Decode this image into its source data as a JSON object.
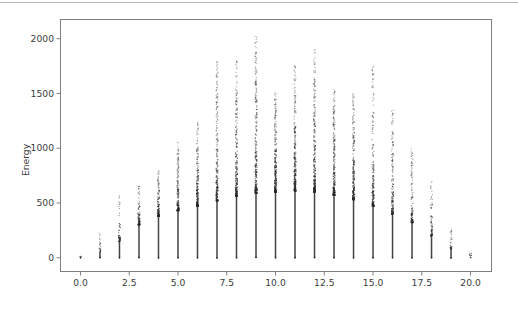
{
  "figure": {
    "background_color": "#ffffff",
    "axes_edge_color": "#7f7f7f",
    "tick_label_color": "#3b3b3b",
    "marker_color": "#2a2a2a",
    "top_rule_color": "#b9b9b9"
  },
  "chart_data": {
    "type": "scatter",
    "title": "",
    "subtitle": "",
    "xlabel": "",
    "ylabel": "Energy",
    "xlim": [
      -1.05,
      21.1
    ],
    "ylim": [
      -130,
      2180
    ],
    "xticks": [
      0.0,
      2.5,
      5.0,
      7.5,
      10.0,
      12.5,
      15.0,
      17.5,
      20.0
    ],
    "xticklabels": [
      "0.0",
      "2.5",
      "5.0",
      "7.5",
      "10.0",
      "12.5",
      "15.0",
      "17.5",
      "20.0"
    ],
    "yticks": [
      0,
      500,
      1000,
      1500,
      2000
    ],
    "yticklabels": [
      "0",
      "500",
      "1000",
      "1500",
      "2000"
    ],
    "grid": false,
    "legend": null,
    "legend_position": "none",
    "marker": "point",
    "marker_size": 1.2,
    "columns": [
      {
        "x": 0,
        "max_energy": 20,
        "dense_top": 8,
        "n_points": 3
      },
      {
        "x": 1,
        "max_energy": 230,
        "dense_top": 60,
        "n_points": 18
      },
      {
        "x": 2,
        "max_energy": 650,
        "dense_top": 150,
        "n_points": 48
      },
      {
        "x": 3,
        "max_energy": 660,
        "dense_top": 300,
        "n_points": 90
      },
      {
        "x": 4,
        "max_energy": 800,
        "dense_top": 380,
        "n_points": 130
      },
      {
        "x": 5,
        "max_energy": 1060,
        "dense_top": 430,
        "n_points": 160
      },
      {
        "x": 6,
        "max_energy": 1250,
        "dense_top": 470,
        "n_points": 190
      },
      {
        "x": 7,
        "max_energy": 1800,
        "dense_top": 520,
        "n_points": 215
      },
      {
        "x": 8,
        "max_energy": 1810,
        "dense_top": 560,
        "n_points": 235
      },
      {
        "x": 9,
        "max_energy": 2050,
        "dense_top": 590,
        "n_points": 250
      },
      {
        "x": 10,
        "max_energy": 1520,
        "dense_top": 600,
        "n_points": 255
      },
      {
        "x": 11,
        "max_energy": 1770,
        "dense_top": 610,
        "n_points": 258
      },
      {
        "x": 12,
        "max_energy": 1900,
        "dense_top": 600,
        "n_points": 252
      },
      {
        "x": 13,
        "max_energy": 1540,
        "dense_top": 570,
        "n_points": 240
      },
      {
        "x": 14,
        "max_energy": 1520,
        "dense_top": 530,
        "n_points": 215
      },
      {
        "x": 15,
        "max_energy": 1780,
        "dense_top": 470,
        "n_points": 185
      },
      {
        "x": 16,
        "max_energy": 1350,
        "dense_top": 400,
        "n_points": 150
      },
      {
        "x": 17,
        "max_energy": 1000,
        "dense_top": 320,
        "n_points": 110
      },
      {
        "x": 18,
        "max_energy": 700,
        "dense_top": 200,
        "n_points": 65
      },
      {
        "x": 19,
        "max_energy": 270,
        "dense_top": 80,
        "n_points": 26
      },
      {
        "x": 20,
        "max_energy": 60,
        "dense_top": 20,
        "n_points": 6
      }
    ]
  },
  "axes_geometry": {
    "left_px": 60,
    "right_px": 492,
    "top_px": 19,
    "bottom_px": 272
  }
}
